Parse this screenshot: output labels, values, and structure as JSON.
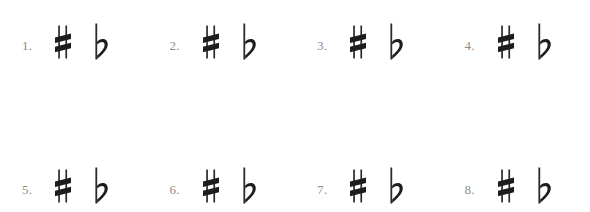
{
  "page": {
    "background_color": "#ffffff",
    "ink_color": "#1d1d1f",
    "number_color": "#8d8d8d"
  },
  "rows": [
    {
      "name": "top-row",
      "items": [
        {
          "number": "1.",
          "accidentals": [
            {
              "icon": "sharp-icon",
              "glyph": "♯",
              "name": "sharp"
            },
            {
              "icon": "flat-icon",
              "glyph": "♭",
              "name": "flat"
            }
          ]
        },
        {
          "number": "2.",
          "accidentals": [
            {
              "icon": "sharp-icon",
              "glyph": "♯",
              "name": "sharp"
            },
            {
              "icon": "flat-icon",
              "glyph": "♭",
              "name": "flat"
            }
          ]
        },
        {
          "number": "3.",
          "accidentals": [
            {
              "icon": "sharp-icon",
              "glyph": "♯",
              "name": "sharp"
            },
            {
              "icon": "flat-icon",
              "glyph": "♭",
              "name": "flat"
            }
          ]
        },
        {
          "number": "4.",
          "accidentals": [
            {
              "icon": "sharp-icon",
              "glyph": "♯",
              "name": "sharp"
            },
            {
              "icon": "flat-icon",
              "glyph": "♭",
              "name": "flat"
            }
          ]
        }
      ]
    },
    {
      "name": "bottom-row",
      "items": [
        {
          "number": "5.",
          "accidentals": [
            {
              "icon": "sharp-icon",
              "glyph": "♯",
              "name": "sharp"
            },
            {
              "icon": "flat-icon",
              "glyph": "♭",
              "name": "flat"
            }
          ]
        },
        {
          "number": "6.",
          "accidentals": [
            {
              "icon": "sharp-icon",
              "glyph": "♯",
              "name": "sharp"
            },
            {
              "icon": "flat-icon",
              "glyph": "♭",
              "name": "flat"
            }
          ]
        },
        {
          "number": "7.",
          "accidentals": [
            {
              "icon": "sharp-icon",
              "glyph": "♯",
              "name": "sharp"
            },
            {
              "icon": "flat-icon",
              "glyph": "♭",
              "name": "flat"
            }
          ]
        },
        {
          "number": "8.",
          "accidentals": [
            {
              "icon": "sharp-icon",
              "glyph": "♯",
              "name": "sharp"
            },
            {
              "icon": "flat-icon",
              "glyph": "♭",
              "name": "flat"
            }
          ]
        }
      ]
    }
  ]
}
